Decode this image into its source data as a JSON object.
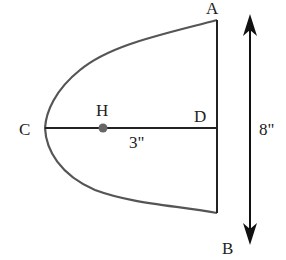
{
  "diagram": {
    "points": {
      "A": {
        "label": "A"
      },
      "B": {
        "label": "B"
      },
      "C": {
        "label": "C"
      },
      "D": {
        "label": "D"
      },
      "H": {
        "label": "H"
      }
    },
    "dimensions": {
      "CD_length": "3\"",
      "AB_length": "8\""
    },
    "colors": {
      "stroke": "#333333",
      "curve": "#555555",
      "point_H": "#666666"
    }
  }
}
